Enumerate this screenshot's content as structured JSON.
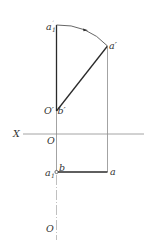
{
  "diagram": {
    "type": "orthographic-projection-rotation",
    "colors": {
      "thick_line": "#2a2a2a",
      "thin_line": "#8c8c8c",
      "axis_line": "#9a9a9a",
      "label": "#333333"
    },
    "axis": {
      "label": "X",
      "origin_label": "O"
    },
    "labels": {
      "a1_prime": "a",
      "a1_prime_sub": "1",
      "a1_prime_mark": "′",
      "a_prime": "a′",
      "O_prime": "O′",
      "b_prime": "b′",
      "O": "O",
      "X": "X",
      "b": "b",
      "a1": "a",
      "a1_sub": "1",
      "a": "a",
      "O_bottom": "O"
    }
  }
}
